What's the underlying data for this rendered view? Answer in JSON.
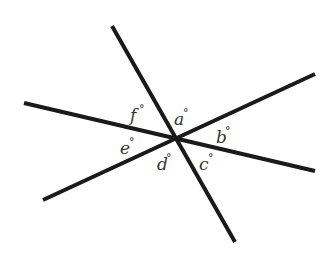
{
  "diagram": {
    "type": "intersecting-lines-angles",
    "intersection": {
      "x": 175,
      "y": 139
    },
    "lines": [
      {
        "id": "steep",
        "x1": 112,
        "y1": 26,
        "x2": 235,
        "y2": 242
      },
      {
        "id": "shallow-down",
        "x1": 24,
        "y1": 103,
        "x2": 315,
        "y2": 171
      },
      {
        "id": "up-right",
        "x1": 43,
        "y1": 200,
        "x2": 315,
        "y2": 74
      }
    ],
    "angles": [
      {
        "letter": "f",
        "symbol": "°",
        "x": 130,
        "y": 121
      },
      {
        "letter": "a",
        "symbol": "°",
        "x": 174,
        "y": 125
      },
      {
        "letter": "b",
        "symbol": "°",
        "x": 216,
        "y": 143
      },
      {
        "letter": "c",
        "symbol": "°",
        "x": 199,
        "y": 170
      },
      {
        "letter": "d",
        "symbol": "°",
        "x": 157,
        "y": 170
      },
      {
        "letter": "e",
        "symbol": "°",
        "x": 120,
        "y": 154
      }
    ]
  }
}
